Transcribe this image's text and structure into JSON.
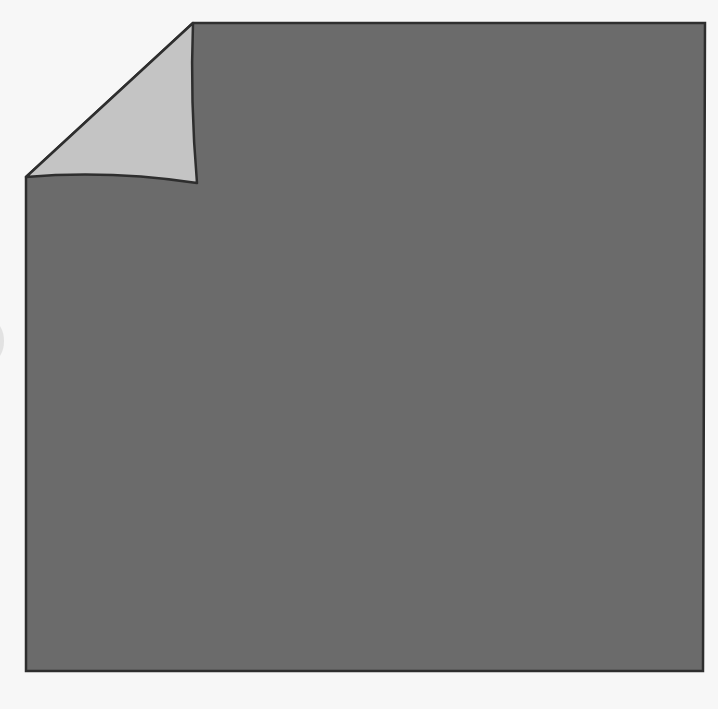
{
  "figure": {
    "colors": {
      "background": "#f7f7f7",
      "sheet_fill": "#6b6b6b",
      "flap_fill": "#c4c4c4",
      "outline": "#2e2e2e"
    },
    "sheet": {
      "top_left_fold_start": [
        193,
        23
      ],
      "top_right": [
        705,
        23
      ],
      "bottom_right": [
        703,
        671
      ],
      "bottom_left": [
        26,
        671
      ],
      "left_fold_start": [
        26,
        177
      ]
    },
    "flap": {
      "tip": [
        197,
        183
      ]
    }
  }
}
